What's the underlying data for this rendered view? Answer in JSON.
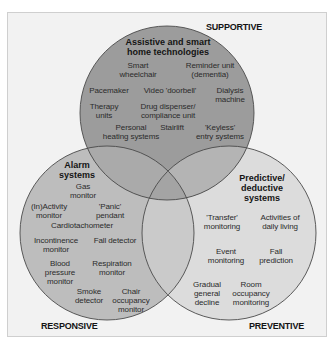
{
  "colors": {
    "background": "#f2f2f2",
    "supportive_circle": "#9c9c9c",
    "responsive_circle": "#bdbdbd",
    "preventive_circle": "#dcdcdc",
    "outline": "#4a4a4a"
  },
  "corners": {
    "supportive": "SUPPORTIVE",
    "responsive": "RESPONSIVE",
    "preventive": "PREVENTIVE"
  },
  "circles": {
    "top": {
      "title": "Assistive and smart\nhome technologies",
      "items": [
        "Smart\nwheelchair",
        "Reminder unit\n(dementia)",
        "Pacemaker",
        "Video 'doorbell'",
        "Dialysis\nmachine",
        "Therapy\nunits",
        "Drug dispenser/\ncompliance unit",
        "Personal\nheating systems",
        "Stairlift",
        "'Keyless'\nentry systems"
      ]
    },
    "left": {
      "title": "Alarm\nsystems",
      "items": [
        "Gas\nmonitor",
        "(In)Activity\nmonitor",
        "'Panic'\npendant",
        "Cardiotachometer",
        "Incontinence\nmonitor",
        "Fall detector",
        "Blood\npressure\nmonitor",
        "Respiration\nmonitor",
        "Smoke\ndetector",
        "Chair\noccupancy\nmonitor"
      ]
    },
    "right": {
      "title": "Predictive/\ndeductive\nsystems",
      "items": [
        "'Transfer'\nmonitoring",
        "Activities of\ndaily living",
        "Event\nmonitoring",
        "Fall\nprediction",
        "Gradual\ngeneral\ndecline",
        "Room\noccupancy\nmonitoring"
      ]
    }
  }
}
